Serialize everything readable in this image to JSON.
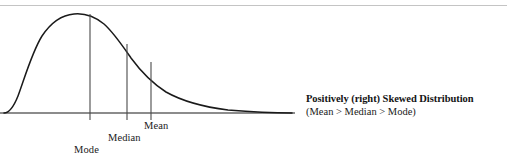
{
  "figure": {
    "clipped_header_remnant": "",
    "caption_title": "Positively (right) Skewed Distribution",
    "caption_subtitle": "(Mean > Median > Mode)",
    "labels": {
      "mode": "Mode",
      "median": "Median",
      "mean": "Mean"
    },
    "colors": {
      "curve": "#1a1a1a",
      "axis": "#1a1a1a",
      "marker_line": "#4a4a4a",
      "top_rule": "#c4c4c4",
      "text": "#141414",
      "background": "#ffffff"
    }
  },
  "chart_data": {
    "type": "line",
    "title": "Positively (right) Skewed Distribution",
    "subtitle": "(Mean > Median > Mode)",
    "xlabel": "",
    "ylabel": "",
    "grid": false,
    "legend_position": "right",
    "axis": {
      "baseline_y": 113,
      "x_start": 0,
      "x_end": 295,
      "y_axis_shown": false,
      "x_ticks_shown": false
    },
    "curve_path": "M 4,113 C 10,113 14,106 18,96 C 24,80 32,52 42,36 C 52,21 62,15 74,14 C 84,13 94,16 104,24 C 114,33 122,45 131,58 C 142,73 152,83 166,92 C 182,101 204,107 228,110 C 252,112 274,113 292,113",
    "markers": [
      {
        "name": "mode",
        "label": "Mode",
        "x": 90,
        "curve_top_y": 14,
        "line_bottom_y": 120,
        "label_x": 74,
        "label_y": 144,
        "note": "peak of the distribution; highest frequency"
      },
      {
        "name": "median",
        "label": "Median",
        "x": 127,
        "curve_top_y": 44,
        "line_bottom_y": 120,
        "label_x": 108,
        "label_y": 132,
        "note": "middle value; lies between mode and mean"
      },
      {
        "name": "mean",
        "label": "Mean",
        "x": 151,
        "curve_top_y": 62,
        "line_bottom_y": 120,
        "label_x": 144,
        "label_y": 120,
        "note": "arithmetic average; pulled toward the long right tail"
      }
    ],
    "ordering_relation": "Mean > Median > Mode",
    "skew_direction": "right (positive)"
  }
}
